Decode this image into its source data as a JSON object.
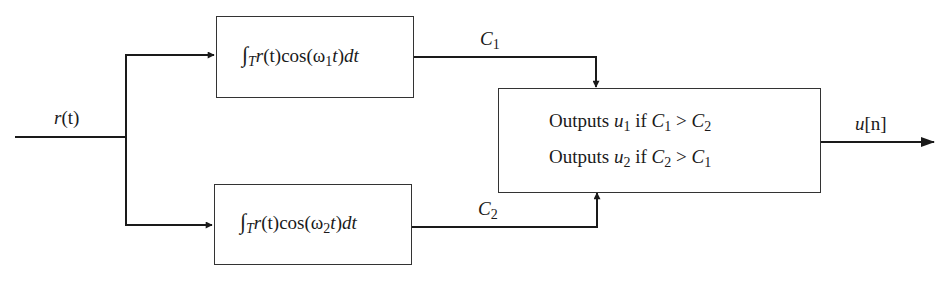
{
  "diagram": {
    "type": "block-diagram",
    "input": {
      "label": "r(t)",
      "label_main": "r",
      "label_arg": "(t)"
    },
    "correlators": [
      {
        "id": "top",
        "integral": "∫",
        "sub_T": "T",
        "expr_r": "r",
        "expr_t1": "(t)",
        "expr_cos": "cos(ω",
        "omega_sub": "1",
        "expr_t2": "t",
        "expr_close": ")",
        "expr_d": "dt",
        "full": "∫_T r(t)cos(ω1 t)dt",
        "output": {
          "main": "C",
          "sub": "1",
          "full": "C1"
        }
      },
      {
        "id": "bottom",
        "integral": "∫",
        "sub_T": "T",
        "expr_r": "r",
        "expr_t1": "(t)",
        "expr_cos": "cos(ω",
        "omega_sub": "2",
        "expr_t2": "t",
        "expr_close": ")",
        "expr_d": "dt",
        "full": "∫_T r(t)cos(ω2 t)dt",
        "output": {
          "main": "C",
          "sub": "2",
          "full": "C2"
        }
      }
    ],
    "decision": {
      "lines": [
        {
          "word": "Outputs",
          "u": "u",
          "u_sub": "1",
          "if": "if",
          "a": "C",
          "a_sub": "1",
          "op": ">",
          "b": "C",
          "b_sub": "2",
          "full": "Outputs u1 if C1 > C2"
        },
        {
          "word": "Outputs",
          "u": "u",
          "u_sub": "2",
          "if": "if",
          "a": "C",
          "a_sub": "2",
          "op": ">",
          "b": "C",
          "b_sub": "1",
          "full": "Outputs u2 if C2 > C1"
        }
      ]
    },
    "output": {
      "label": "u[n]",
      "main": "u",
      "bracket": "[n]"
    },
    "colors": {
      "stroke": "#1a1a1a",
      "background": "#ffffff"
    }
  }
}
